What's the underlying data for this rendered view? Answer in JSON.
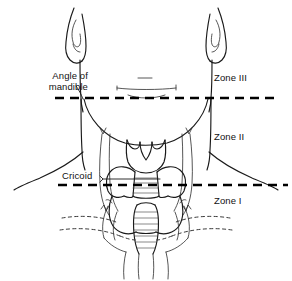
{
  "figure": {
    "background_color": "#ffffff",
    "line_color": "#1a1a1a",
    "width": 292,
    "height": 281
  },
  "labels": {
    "angle_of_mandible_line1": "Angle of",
    "angle_of_mandible_line2": "mandible",
    "cricoid": "Cricoid",
    "zone_3": "Zone III",
    "zone_2": "Zone II",
    "zone_1": "Zone I"
  },
  "landmarks": [
    {
      "name": "angle-of-mandible",
      "label": "Angle of mandible",
      "boundary_y": 98,
      "separates": [
        "Zone III",
        "Zone II"
      ]
    },
    {
      "name": "cricoid",
      "label": "Cricoid",
      "boundary_y": 185,
      "separates": [
        "Zone II",
        "Zone I"
      ]
    }
  ],
  "zones": [
    {
      "name": "Zone III",
      "upper_bound": "skull base",
      "lower_bound": "angle of mandible"
    },
    {
      "name": "Zone II",
      "upper_bound": "angle of mandible",
      "lower_bound": "cricoid cartilage"
    },
    {
      "name": "Zone I",
      "upper_bound": "cricoid cartilage",
      "lower_bound": "clavicles"
    }
  ],
  "structures": [
    "ear",
    "mandible",
    "jawline",
    "sternocleidomastoid-left",
    "sternocleidomastoid-right",
    "thyroid-cartilage",
    "cricoid-cartilage",
    "thyroid-gland",
    "trachea",
    "clavicle-left",
    "clavicle-right"
  ]
}
